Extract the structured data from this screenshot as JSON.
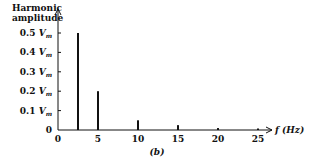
{
  "chart_data": {
    "type": "bar",
    "title": "",
    "ylabel": "Harmonic amplitude",
    "xlabel": "f (Hz)",
    "caption": "(b)",
    "x": [
      2.5,
      5,
      10,
      15,
      20,
      25
    ],
    "values": [
      0.5,
      0.2,
      0.05,
      0.025,
      0.01,
      0.005
    ],
    "value_unit": "V_m",
    "xticks": [
      "0",
      "5",
      "10",
      "15",
      "20",
      "25"
    ],
    "yticks": [
      "0",
      "0.1 V_m",
      "0.2 V_m",
      "0.3 V_m",
      "0.4 V_m",
      "0.5 V_m"
    ],
    "xlim": [
      0,
      27
    ],
    "ylim": [
      0,
      0.55
    ],
    "grid": false,
    "legend": null
  },
  "labels": {
    "ylabel_line1": "Harmonic",
    "ylabel_line2": "amplitude",
    "xlabel": "f (Hz)",
    "caption": "(b)",
    "ytick_values": [
      "0.5",
      "0.4",
      "0.3",
      "0.2",
      "0.1"
    ],
    "ytick_unit": "V",
    "ytick_sub": "m",
    "ytick_zero": "0",
    "xticks": [
      "0",
      "5",
      "10",
      "15",
      "20",
      "25"
    ]
  }
}
